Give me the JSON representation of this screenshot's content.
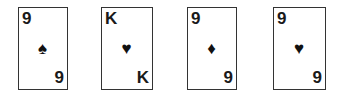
{
  "cards": [
    {
      "rank": "9",
      "suit": "spades",
      "suit_glyph": "♠",
      "color": "#111111"
    },
    {
      "rank": "K",
      "suit": "hearts",
      "suit_glyph": "♥",
      "color": "#111111"
    },
    {
      "rank": "9",
      "suit": "diamonds",
      "suit_glyph": "♦",
      "color": "#111111"
    },
    {
      "rank": "9",
      "suit": "hearts",
      "suit_glyph": "♥",
      "color": "#111111"
    }
  ]
}
